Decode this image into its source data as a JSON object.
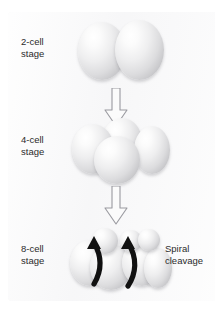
{
  "figure": {
    "title": "Protostomes",
    "title_clipped": true,
    "background_color": "#ffffff",
    "panel_color": "#f7f7f8"
  },
  "stages": [
    {
      "id": "two-cell",
      "label_line1": "2-cell",
      "label_line2": "stage",
      "cell_count": 2
    },
    {
      "id": "four-cell",
      "label_line1": "4-cell",
      "label_line2": "stage",
      "cell_count": 4
    },
    {
      "id": "eight-cell",
      "label_line1": "8-cell",
      "label_line2": "stage",
      "cell_count": 8
    }
  ],
  "annotation": {
    "line1": "Spiral",
    "line2": "cleavage",
    "arrow_color": "#111111"
  },
  "arrows": {
    "count": 2,
    "direction": "down",
    "fill": "#fbfbfb",
    "stroke": "#9a9aa0"
  },
  "colors": {
    "cell_highlight": "#ffffff",
    "cell_midtone": "#dcdcde",
    "cell_shadow": "#ababaf",
    "text": "#2b2b2b"
  }
}
